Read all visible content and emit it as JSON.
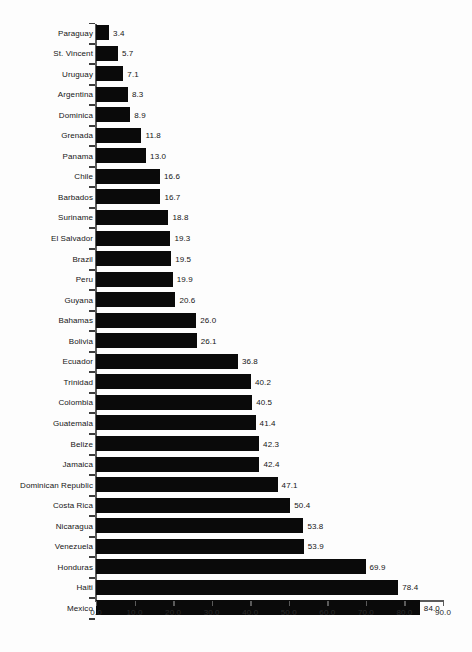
{
  "chart_data": {
    "type": "bar",
    "orientation": "horizontal",
    "title": "",
    "subtitle": "",
    "xlabel": "",
    "ylabel": "",
    "xlim": [
      0.0,
      90.0
    ],
    "xtick_step": 10.0,
    "grid": false,
    "legend": false,
    "bar_color": "#0a0a0a",
    "background_color": "#fdfdfd",
    "axis_color": "#5a5a5a",
    "text_color": "#151515",
    "sort_order": "ascending",
    "value_labels_shown": true,
    "xticks": [
      "0.0",
      "10.0",
      "20.0",
      "30.0",
      "40.0",
      "50.0",
      "60.0",
      "70.0",
      "80.0",
      "90.0"
    ],
    "categories": [
      "Paraguay",
      "St. Vincent",
      "Uruguay",
      "Argentina",
      "Dominica",
      "Grenada",
      "Panama",
      "Chile",
      "Barbados",
      "Suriname",
      "El Salvador",
      "Brazil",
      "Peru",
      "Guyana",
      "Bahamas",
      "Bolivia",
      "Ecuador",
      "Trinidad",
      "Colombia",
      "Guatemala",
      "Belize",
      "Jamaica",
      "Dominican Republic",
      "Costa Rica",
      "Nicaragua",
      "Venezuela",
      "Honduras",
      "Haiti",
      "Mexico"
    ],
    "values": [
      3.4,
      5.7,
      7.1,
      8.3,
      8.9,
      11.8,
      13.0,
      16.6,
      16.7,
      18.8,
      19.3,
      19.5,
      19.9,
      20.6,
      26.0,
      26.1,
      36.8,
      40.2,
      40.5,
      41.4,
      42.3,
      42.4,
      47.1,
      50.4,
      53.8,
      53.9,
      69.9,
      78.4,
      84.0
    ],
    "value_labels": [
      "3.4",
      "5.7",
      "7.1",
      "8.3",
      "8.9",
      "11.8",
      "13.0",
      "16.6",
      "16.7",
      "18.8",
      "19.3",
      "19.5",
      "19.9",
      "20.6",
      "26.0",
      "26.1",
      "36.8",
      "40.2",
      "40.5",
      "41.4",
      "42.3",
      "42.4",
      "47.1",
      "50.4",
      "53.8",
      "53.9",
      "69.9",
      "78.4",
      "84.0"
    ]
  }
}
